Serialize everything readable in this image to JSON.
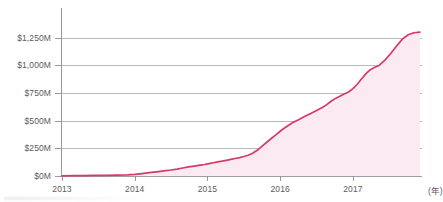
{
  "chart_data": {
    "type": "area",
    "title": "",
    "subtitle": "",
    "xlabel": "(年)",
    "ylabel": "",
    "xlim": [
      2013,
      2017.95
    ],
    "ylim": [
      0,
      1375
    ],
    "grid": true,
    "legend": null,
    "y_ticks": [
      0,
      250,
      500,
      750,
      1000,
      1250
    ],
    "y_ticklabels": [
      "$0M",
      "$250M",
      "$500M",
      "$750M",
      "$1,000M",
      "$1,250M"
    ],
    "x_ticks": [
      2013,
      2014,
      2015,
      2016,
      2017
    ],
    "x_ticklabels": [
      "2013",
      "2014",
      "2015",
      "2016",
      "2017"
    ],
    "x_unit_label": "(年)",
    "series": [
      {
        "name": "cumulative",
        "line_color": "#d6396b",
        "fill_color": "#fbeaf1",
        "x": [
          2013.0,
          2013.15,
          2013.3,
          2013.45,
          2013.6,
          2013.75,
          2013.9,
          2014.0,
          2014.1,
          2014.2,
          2014.3,
          2014.4,
          2014.5,
          2014.58,
          2014.66,
          2014.74,
          2014.82,
          2014.9,
          2014.96,
          2015.02,
          2015.08,
          2015.14,
          2015.2,
          2015.26,
          2015.32,
          2015.38,
          2015.44,
          2015.5,
          2015.56,
          2015.62,
          2015.7,
          2015.78,
          2015.86,
          2015.94,
          2016.02,
          2016.1,
          2016.18,
          2016.26,
          2016.34,
          2016.42,
          2016.5,
          2016.58,
          2016.64,
          2016.7,
          2016.76,
          2016.82,
          2016.88,
          2016.94,
          2017.0,
          2017.06,
          2017.12,
          2017.18,
          2017.24,
          2017.3,
          2017.36,
          2017.44,
          2017.52,
          2017.6,
          2017.68,
          2017.76,
          2017.84,
          2017.92
        ],
        "y": [
          2,
          3,
          4,
          5,
          6,
          8,
          10,
          14,
          22,
          30,
          38,
          46,
          54,
          62,
          72,
          82,
          90,
          98,
          104,
          112,
          120,
          128,
          134,
          142,
          150,
          158,
          166,
          176,
          188,
          206,
          240,
          286,
          330,
          372,
          416,
          452,
          486,
          512,
          540,
          566,
          592,
          620,
          646,
          676,
          702,
          722,
          742,
          760,
          790,
          830,
          880,
          926,
          962,
          984,
          1000,
          1048,
          1108,
          1176,
          1238,
          1278,
          1296,
          1302
        ]
      }
    ]
  }
}
